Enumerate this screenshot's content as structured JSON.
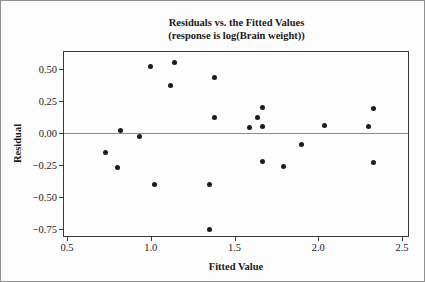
{
  "chart_data": {
    "type": "scatter",
    "title": "Residuals vs. the Fitted Values",
    "subtitle": "(response is log(Brain weight))",
    "xlabel": "Fitted Value",
    "ylabel": "Residual",
    "x_ticks": [
      0.5,
      1.0,
      1.5,
      2.0,
      2.5
    ],
    "x_tick_labels": [
      "0.5",
      "1.0",
      "1.5",
      "2.0",
      "2.5"
    ],
    "y_ticks": [
      0.5,
      0.25,
      0.0,
      -0.25,
      -0.5,
      -0.75
    ],
    "y_tick_labels": [
      "0.50",
      "0.25",
      "0.00",
      "−0.25",
      "−0.50",
      "−0.75"
    ],
    "xlim": [
      0.47,
      2.54
    ],
    "ylim": [
      -0.81,
      0.64
    ],
    "grid": false,
    "legend": "none",
    "reference_line_y": 0,
    "marker": {
      "shape": "circle",
      "color": "#1c1c1c",
      "size_px": 5
    },
    "points": [
      [
        0.73,
        -0.15
      ],
      [
        0.8,
        -0.27
      ],
      [
        0.82,
        0.02
      ],
      [
        0.93,
        -0.03
      ],
      [
        1.0,
        0.52
      ],
      [
        1.02,
        -0.4
      ],
      [
        1.12,
        0.37
      ],
      [
        1.14,
        0.55
      ],
      [
        1.35,
        -0.4
      ],
      [
        1.35,
        -0.75
      ],
      [
        1.38,
        0.43
      ],
      [
        1.38,
        0.12
      ],
      [
        1.59,
        0.04
      ],
      [
        1.64,
        0.12
      ],
      [
        1.67,
        0.2
      ],
      [
        1.67,
        0.05
      ],
      [
        1.67,
        -0.22
      ],
      [
        1.79,
        -0.26
      ],
      [
        1.9,
        -0.09
      ],
      [
        2.04,
        0.06
      ],
      [
        2.3,
        0.05
      ],
      [
        2.33,
        0.19
      ],
      [
        2.33,
        -0.23
      ]
    ]
  }
}
